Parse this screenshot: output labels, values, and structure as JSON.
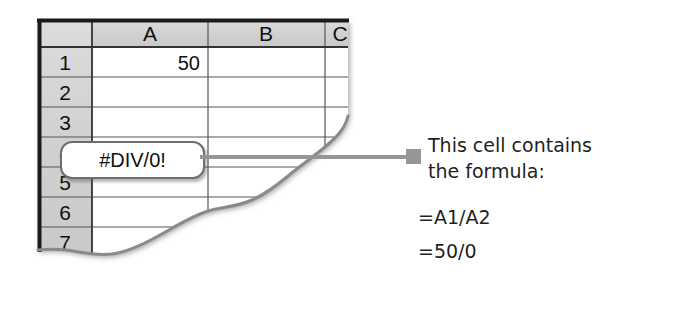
{
  "spreadsheet": {
    "column_headers": [
      "A",
      "B",
      "C"
    ],
    "row_headers": [
      "1",
      "2",
      "3",
      "4",
      "5",
      "6",
      "7"
    ],
    "cells": {
      "A1": "50",
      "A4": "#DIV/0!"
    },
    "colors": {
      "header_fill": "#d4d4d4",
      "grid_line": "#555555",
      "frame": "#1a1a1a",
      "cell_fill": "#ffffff"
    }
  },
  "callout": {
    "value": "#DIV/0!",
    "border_color": "#6e6e6e"
  },
  "leader": {
    "marker": "square-marker-icon",
    "color": "#969696"
  },
  "annotation": {
    "line1": "This cell contains",
    "line2": "the formula:",
    "formula1": "=A1/A2",
    "formula2": "=50/0",
    "text_color": "#1f1f1f"
  }
}
